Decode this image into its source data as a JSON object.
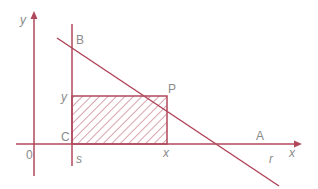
{
  "colors": {
    "stroke": "#b0485c",
    "label": "#8a8a8a",
    "background": "#ffffff"
  },
  "axes": {
    "x_label": "x",
    "y_label": "y",
    "origin_label": "0"
  },
  "lines": {
    "vertical_line_label": "s",
    "slanted_line_label": "r"
  },
  "points": {
    "A": "A",
    "B": "B",
    "C": "C",
    "P": "P"
  },
  "rectangle": {
    "width_label": "x",
    "height_label": "y",
    "fill": "hatched"
  }
}
